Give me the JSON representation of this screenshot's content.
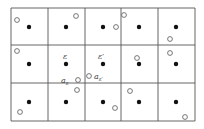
{
  "diagram": {
    "grid": {
      "columns": 5,
      "rows": 3
    },
    "filled_points": "one per cell, at cell center",
    "labels": {
      "cell_a": "ε",
      "cell_b": "ε′",
      "point_a_base": "a",
      "point_a_sub": "ε",
      "point_b_base": "a",
      "point_b_sub": "ε′"
    },
    "colors": {
      "line": "#555555",
      "filled": "#111111",
      "open_stroke": "#555555"
    }
  }
}
